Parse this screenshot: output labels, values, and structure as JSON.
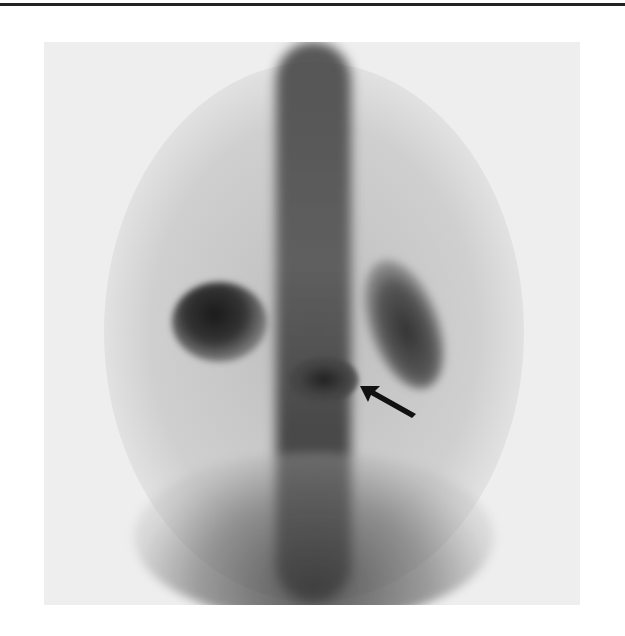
{
  "figure": {
    "type": "bone-scintigraphy",
    "view": "posterior",
    "annotation": {
      "kind": "arrow",
      "points_to": "focal-uptake-lesion"
    },
    "colors": {
      "rule": "#222222",
      "panel": "#eeeeee",
      "uptake": "#1a1a1a"
    }
  }
}
